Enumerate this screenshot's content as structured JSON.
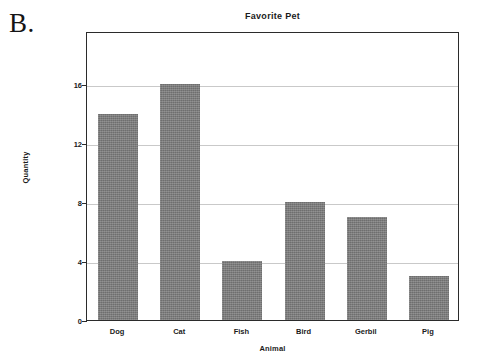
{
  "figure": {
    "panel_letter": "B."
  },
  "chart_data": {
    "type": "bar",
    "title": "Favorite Pet",
    "xlabel": "Animal",
    "ylabel": "Quantity",
    "categories": [
      "Dog",
      "Cat",
      "Fish",
      "Bird",
      "Gerbil",
      "Pig"
    ],
    "values": [
      14,
      16,
      4,
      8,
      7,
      3
    ],
    "ylim": [
      0,
      19.6
    ],
    "yticks": [
      0,
      4,
      8,
      12,
      16
    ],
    "ytick_labels": [
      "0",
      "4",
      "8",
      "12",
      "16"
    ],
    "grid": true,
    "legend": false,
    "bar_color": "#7c7c7c",
    "axis_color": "#2b2b2b",
    "grid_color": "#c9c9c9",
    "background": "#ffffff"
  }
}
